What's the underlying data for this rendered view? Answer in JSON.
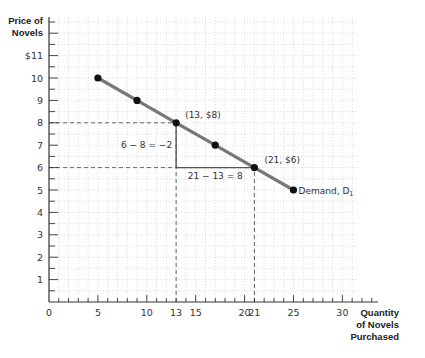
{
  "chart_data": {
    "type": "line",
    "title": "",
    "xlabel": "Quantity of Novels Purchased",
    "ylabel": "Price of Novels",
    "xlabel_lines": [
      "Quantity",
      "of Novels",
      "Purchased"
    ],
    "ylabel_lines": [
      "Price of",
      "Novels"
    ],
    "xlim": [
      0,
      33
    ],
    "ylim": [
      0,
      12
    ],
    "grid": true,
    "x_ticks": [
      {
        "value": 0,
        "label": "0"
      },
      {
        "value": 5,
        "label": "5"
      },
      {
        "value": 10,
        "label": "10"
      },
      {
        "value": 13,
        "label": "13"
      },
      {
        "value": 15,
        "label": "15"
      },
      {
        "value": 20,
        "label": "20"
      },
      {
        "value": 21,
        "label": "21"
      },
      {
        "value": 25,
        "label": "25"
      },
      {
        "value": 30,
        "label": "30"
      }
    ],
    "y_ticks": [
      {
        "value": 1,
        "label": "1"
      },
      {
        "value": 2,
        "label": "2"
      },
      {
        "value": 3,
        "label": "3"
      },
      {
        "value": 4,
        "label": "4"
      },
      {
        "value": 5,
        "label": "5"
      },
      {
        "value": 6,
        "label": "6"
      },
      {
        "value": 7,
        "label": "7"
      },
      {
        "value": 8,
        "label": "8"
      },
      {
        "value": 9,
        "label": "9"
      },
      {
        "value": 10,
        "label": "10"
      },
      {
        "value": 11,
        "label": "$11"
      }
    ],
    "series": [
      {
        "name": "Demand, D1",
        "label": "Demand, D",
        "label_subscript": "1",
        "color": "#777777",
        "points": [
          {
            "x": 5,
            "y": 10
          },
          {
            "x": 9,
            "y": 9
          },
          {
            "x": 13,
            "y": 8
          },
          {
            "x": 17,
            "y": 7
          },
          {
            "x": 21,
            "y": 6
          },
          {
            "x": 25,
            "y": 5
          }
        ]
      }
    ],
    "annotations": [
      {
        "text": "(13, $8)",
        "x": 13,
        "y": 8
      },
      {
        "text": "(21, $6)",
        "x": 21,
        "y": 6
      },
      {
        "text": "6 − 8 = −2",
        "type": "rise"
      },
      {
        "text": "21 − 13 = 8",
        "type": "run"
      }
    ],
    "guides": [
      {
        "type": "dashed",
        "from": [
          0,
          8
        ],
        "to": [
          13,
          8
        ]
      },
      {
        "type": "dashed",
        "from": [
          13,
          0
        ],
        "to": [
          13,
          8
        ]
      },
      {
        "type": "dashed",
        "from": [
          0,
          6
        ],
        "to": [
          21,
          6
        ]
      },
      {
        "type": "dashed",
        "from": [
          21,
          0
        ],
        "to": [
          21,
          6
        ]
      }
    ]
  }
}
